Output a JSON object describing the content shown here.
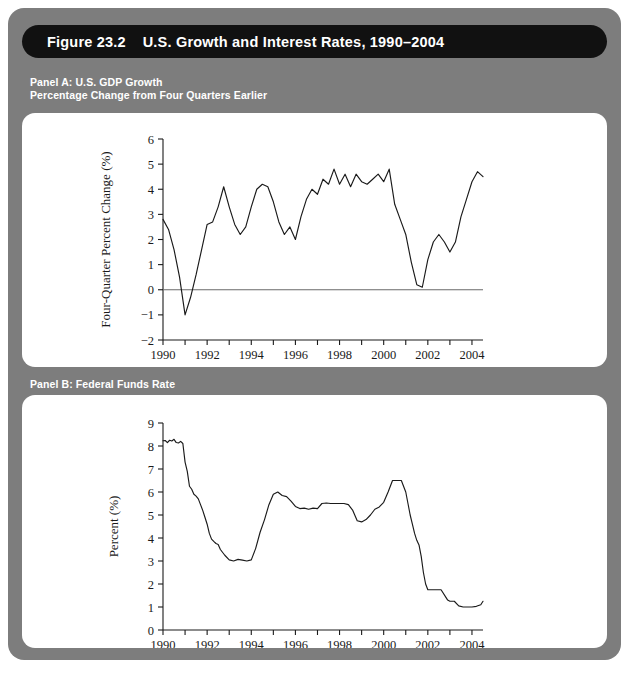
{
  "figure": {
    "title": "Figure 23.2    U.S. Growth and Interest Rates, 1990–2004",
    "panel_a_caption": "Panel A: U.S. GDP Growth\nPercentage Change from Four Quarters Earlier",
    "panel_b_caption": "Panel B: Federal Funds Rate",
    "colors": {
      "frame": "#7d7d7d",
      "title_bar": "#111111",
      "title_text": "#ffffff",
      "caption_text": "#ffffff",
      "card": "#ffffff",
      "line": "#1a1a1a",
      "zero_line": "#6a6a6a"
    }
  },
  "chart_data": [
    {
      "type": "line",
      "id": "panel-a",
      "title": "Panel A: U.S. GDP Growth",
      "subtitle": "Percentage Change from Four Quarters Earlier",
      "xlabel": "",
      "ylabel": "Four-Quarter Percent Change (%)",
      "xlim": [
        1990.0,
        2004.5
      ],
      "ylim": [
        -2,
        6
      ],
      "yticks": [
        -2,
        -1,
        0,
        1,
        2,
        3,
        4,
        5,
        6
      ],
      "ytick_labels": [
        "−2",
        "−1",
        "0",
        "1",
        "2",
        "3",
        "4",
        "5",
        "6"
      ],
      "xticks": [
        1990,
        1991,
        1992,
        1993,
        1994,
        1995,
        1996,
        1997,
        1998,
        1999,
        2000,
        2001,
        2002,
        2003,
        2004
      ],
      "xtick_labels_shown": [
        "1990",
        "1992",
        "1994",
        "1996",
        "1998",
        "2000",
        "2002",
        "2004"
      ],
      "grid": false,
      "legend": false,
      "zero_line": true,
      "series": [
        {
          "name": "U.S. GDP growth, four-quarter percent change",
          "x": [
            1990.0,
            1990.25,
            1990.5,
            1990.75,
            1991.0,
            1991.25,
            1991.5,
            1991.75,
            1992.0,
            1992.25,
            1992.5,
            1992.75,
            1993.0,
            1993.25,
            1993.5,
            1993.75,
            1994.0,
            1994.25,
            1994.5,
            1994.75,
            1995.0,
            1995.25,
            1995.5,
            1995.75,
            1996.0,
            1996.25,
            1996.5,
            1996.75,
            1997.0,
            1997.25,
            1997.5,
            1997.75,
            1998.0,
            1998.25,
            1998.5,
            1998.75,
            1999.0,
            1999.25,
            1999.5,
            1999.75,
            2000.0,
            2000.25,
            2000.5,
            2000.75,
            2001.0,
            2001.25,
            2001.5,
            2001.75,
            2002.0,
            2002.25,
            2002.5,
            2002.75,
            2003.0,
            2003.25,
            2003.5,
            2003.75,
            2004.0,
            2004.25,
            2004.5
          ],
          "y": [
            2.8,
            2.4,
            1.6,
            0.5,
            -1.0,
            -0.3,
            0.6,
            1.6,
            2.6,
            2.7,
            3.3,
            4.1,
            3.3,
            2.6,
            2.2,
            2.5,
            3.3,
            4.0,
            4.2,
            4.1,
            3.5,
            2.7,
            2.2,
            2.5,
            2.0,
            2.9,
            3.6,
            4.0,
            3.8,
            4.4,
            4.2,
            4.8,
            4.2,
            4.6,
            4.1,
            4.6,
            4.3,
            4.2,
            4.4,
            4.6,
            4.3,
            4.8,
            3.4,
            2.8,
            2.2,
            1.1,
            0.2,
            0.1,
            1.2,
            1.9,
            2.2,
            1.9,
            1.5,
            1.9,
            2.9,
            3.6,
            4.3,
            4.7,
            4.5
          ]
        }
      ]
    },
    {
      "type": "line",
      "id": "panel-b",
      "title": "Panel B: Federal Funds Rate",
      "subtitle": "",
      "xlabel": "",
      "ylabel": "Percent (%)",
      "xlim": [
        1990.0,
        2004.5
      ],
      "ylim": [
        0,
        9
      ],
      "yticks": [
        0,
        1,
        2,
        3,
        4,
        5,
        6,
        7,
        8,
        9
      ],
      "ytick_labels": [
        "0",
        "1",
        "2",
        "3",
        "4",
        "5",
        "6",
        "7",
        "8",
        "9"
      ],
      "xticks": [
        1990,
        1991,
        1992,
        1993,
        1994,
        1995,
        1996,
        1997,
        1998,
        1999,
        2000,
        2001,
        2002,
        2003,
        2004
      ],
      "xtick_labels_shown": [
        "1990",
        "1992",
        "1994",
        "1996",
        "1998",
        "2000",
        "2002",
        "2004"
      ],
      "grid": false,
      "legend": false,
      "zero_line": false,
      "series": [
        {
          "name": "Federal funds rate",
          "x": [
            1990.0,
            1990.1,
            1990.2,
            1990.3,
            1990.4,
            1990.5,
            1990.6,
            1990.7,
            1990.8,
            1990.9,
            1991.0,
            1991.1,
            1991.2,
            1991.3,
            1991.4,
            1991.5,
            1991.6,
            1991.7,
            1991.8,
            1991.9,
            1992.0,
            1992.1,
            1992.2,
            1992.3,
            1992.4,
            1992.5,
            1992.6,
            1992.8,
            1993.0,
            1993.2,
            1993.4,
            1993.6,
            1993.8,
            1994.0,
            1994.2,
            1994.4,
            1994.6,
            1994.8,
            1995.0,
            1995.2,
            1995.4,
            1995.6,
            1995.8,
            1996.0,
            1996.2,
            1996.4,
            1996.6,
            1996.8,
            1997.0,
            1997.2,
            1997.4,
            1997.6,
            1997.8,
            1998.0,
            1998.2,
            1998.4,
            1998.6,
            1998.8,
            1999.0,
            1999.2,
            1999.4,
            1999.6,
            1999.8,
            2000.0,
            2000.2,
            2000.4,
            2000.6,
            2000.8,
            2001.0,
            2001.1,
            2001.2,
            2001.3,
            2001.4,
            2001.5,
            2001.6,
            2001.7,
            2001.8,
            2001.9,
            2002.0,
            2002.2,
            2002.4,
            2002.6,
            2002.9,
            2003.0,
            2003.2,
            2003.4,
            2003.6,
            2003.8,
            2004.0,
            2004.2,
            2004.4,
            2004.5
          ],
          "y": [
            8.23,
            8.24,
            8.15,
            8.25,
            8.22,
            8.29,
            8.15,
            8.13,
            8.2,
            8.11,
            7.3,
            6.9,
            6.25,
            6.12,
            5.9,
            5.82,
            5.7,
            5.45,
            5.2,
            4.9,
            4.6,
            4.2,
            3.95,
            3.85,
            3.76,
            3.72,
            3.5,
            3.25,
            3.05,
            3.0,
            3.07,
            3.04,
            3.0,
            3.05,
            3.55,
            4.25,
            4.8,
            5.45,
            5.9,
            6.0,
            5.85,
            5.8,
            5.6,
            5.37,
            5.28,
            5.3,
            5.25,
            5.3,
            5.28,
            5.5,
            5.52,
            5.5,
            5.5,
            5.5,
            5.5,
            5.45,
            5.2,
            4.75,
            4.7,
            4.8,
            5.0,
            5.25,
            5.35,
            5.55,
            6.0,
            6.5,
            6.5,
            6.5,
            6.0,
            5.5,
            5.0,
            4.6,
            4.2,
            3.9,
            3.7,
            3.2,
            2.5,
            2.0,
            1.75,
            1.75,
            1.75,
            1.75,
            1.3,
            1.25,
            1.25,
            1.05,
            1.0,
            1.0,
            1.0,
            1.03,
            1.1,
            1.25
          ]
        }
      ]
    }
  ]
}
